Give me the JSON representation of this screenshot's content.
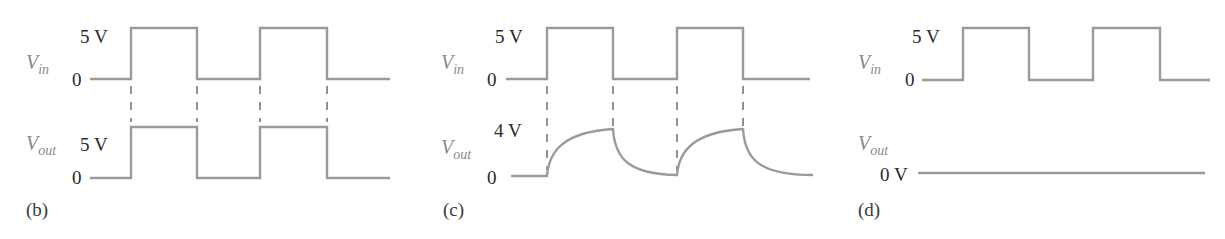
{
  "panels": [
    {
      "id": "b",
      "caption": "(b)",
      "vin": {
        "name": "V",
        "sub": "in",
        "high_label": "5 V",
        "low_label": "0"
      },
      "vout": {
        "name": "V",
        "sub": "out",
        "high_label": "5 V",
        "low_label": "0",
        "shape": "square (follows input exactly)"
      }
    },
    {
      "id": "c",
      "caption": "(c)",
      "vin": {
        "name": "V",
        "sub": "in",
        "high_label": "5 V",
        "low_label": "0"
      },
      "vout": {
        "name": "V",
        "sub": "out",
        "high_label": "4 V",
        "low_label": "0",
        "shape": "exponential charge/discharge (RC)"
      }
    },
    {
      "id": "d",
      "caption": "(d)",
      "vin": {
        "name": "V",
        "sub": "in",
        "high_label": "5 V",
        "low_label": "0"
      },
      "vout": {
        "name": "V",
        "sub": "out",
        "level_label": "0 V",
        "shape": "flat at 0 V"
      }
    }
  ],
  "colors": {
    "trace": "#9a9a9a",
    "dash": "#555555",
    "text": "#2a2a2a",
    "signal_label": "#8a8a8a"
  }
}
